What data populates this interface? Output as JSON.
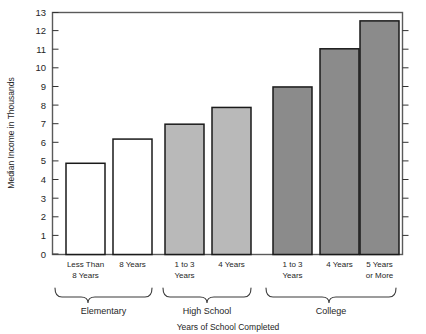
{
  "chart_data": {
    "type": "bar",
    "title": "",
    "xlabel": "Years of School Completed",
    "ylabel": "Median Income in Thousands",
    "ylim": [
      0,
      13
    ],
    "ytick_values": [
      0,
      1,
      2,
      3,
      4,
      5,
      6,
      7,
      8,
      9,
      10,
      11,
      12,
      13
    ],
    "ytick_labels": [
      "0",
      "1",
      "2",
      "3",
      "4",
      "5",
      "6",
      "7",
      "8",
      "9",
      "10",
      "11",
      "12",
      "13"
    ],
    "grid": false,
    "legend": "none",
    "categories": [
      "Less Than 8 Years",
      "8 Years",
      "1 to 3 Years",
      "4 Years",
      "1 to 3 Years",
      "4 Years",
      "5 Years or More"
    ],
    "values": [
      4.9,
      6.2,
      7.0,
      7.9,
      9.0,
      11.05,
      12.55
    ],
    "bar_fills": [
      "#ffffff",
      "#ffffff",
      "#b9b9b9",
      "#b9b9b9",
      "#8b8b8b",
      "#8b8b8b",
      "#8b8b8b"
    ],
    "groups": [
      {
        "label": "Elementary",
        "bars": [
          0,
          1
        ]
      },
      {
        "label": "High School",
        "bars": [
          2,
          3
        ]
      },
      {
        "label": "College",
        "bars": [
          4,
          5,
          6
        ]
      }
    ]
  },
  "bars": [
    {
      "line1": "Less Than",
      "line2": "8 Years",
      "value": 4.9,
      "fill": "#ffffff"
    },
    {
      "line1": "8 Years",
      "line2": "",
      "value": 6.2,
      "fill": "#ffffff"
    },
    {
      "line1": "1 to 3",
      "line2": "Years",
      "value": 7.0,
      "fill": "#b9b9b9"
    },
    {
      "line1": "4 Years",
      "line2": "",
      "value": 7.9,
      "fill": "#b9b9b9"
    },
    {
      "line1": "1 to 3",
      "line2": "Years",
      "value": 9.0,
      "fill": "#8b8b8b"
    },
    {
      "line1": "4 Years",
      "line2": "",
      "value": 11.05,
      "fill": "#8b8b8b"
    },
    {
      "line1": "5 Years",
      "line2": "or More",
      "value": 12.55,
      "fill": "#8b8b8b"
    }
  ],
  "axes": {
    "y_title": "Median Income in Thousands",
    "x_title": "Years of School Completed",
    "ticks": [
      "13",
      "12",
      "11",
      "10",
      "9",
      "8",
      "7",
      "6",
      "5",
      "4",
      "3",
      "2",
      "1",
      "0"
    ]
  },
  "groups": [
    {
      "label": "Elementary"
    },
    {
      "label": "High School"
    },
    {
      "label": "College"
    }
  ],
  "colors": {
    "frame": "#4d4d4d",
    "bar_outline": "#1a1a1a",
    "elementary_fill": "#ffffff",
    "highschool_fill": "#b9b9b9",
    "college_fill": "#8b8b8b",
    "text": "#262626",
    "background": "#ffffff"
  }
}
